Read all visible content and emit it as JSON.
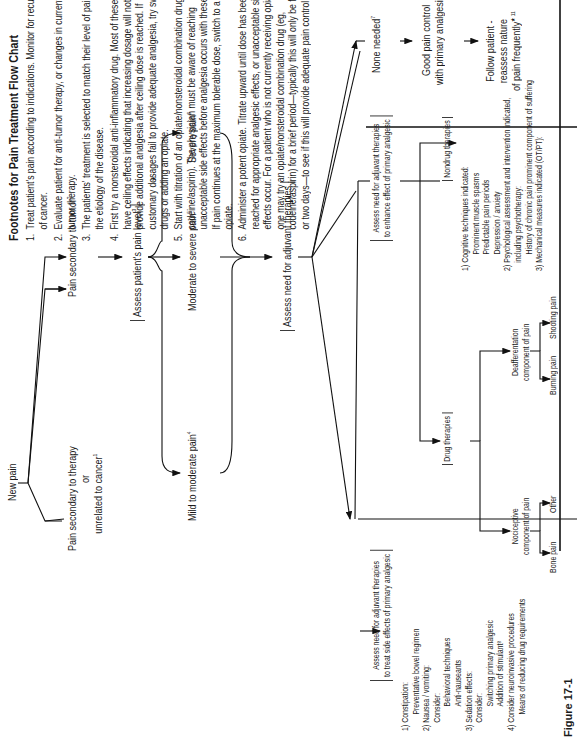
{
  "footnotes": {
    "title": "Footnotes for Pain Treatment Flow Chart",
    "items": [
      {
        "num": "1.",
        "text": "Treat patient's pain according to indications. Monitor for recurrence of cancer."
      },
      {
        "num": "2.",
        "text": "Evaluate patient for anti-tumor therapy, or changes in current anti-tumor therapy."
      },
      {
        "num": "3.",
        "text": "The patients' treatment is selected to match their level of pain, not the etiology of the disease."
      },
      {
        "num": "4.",
        "text": "First try a nonsteroidal anti-inflammatory drug. Most of these drugs have ceiling effects indicating that increasing dosage will not provide additional analgesia after ceiling dose is reached. If customary dosages fail to provide adequate analgesia, try switching drugs or adding an opiate."
      },
      {
        "num": "5.",
        "text": "Start with titration of an opiate/nonsteroidal combination drug (eg, codeine/aspirin). The physician must be aware of reaching unacceptable side effects before analgesia occurs with these drugs. If pain continues at the maximum tolerable dose, switch to a potent opiate."
      },
      {
        "num": "6.",
        "text": "Administer a potent opiate. Titrate upward until dose has been reached for appropriate analgesic effects, or unacceptable side effects occur. For a patient who is not currently receiving opiates, one may try an opiate/nonsteroidal combination drug (eg, codeine/aspirin) for a brief period—typically this will only be for one or two days—to see if this will provide adequate pain control."
      }
    ]
  },
  "flow": {
    "new_pain": "New pain",
    "pain_tumor": "Pain secondary to tumor",
    "pain_tumor_sup": "2",
    "pain_therapy_l1": "Pain secondary to therapy",
    "pain_therapy_l2": "or",
    "pain_therapy_l3": "unrelated to cancer",
    "pain_therapy_sup": "1",
    "assess_level": "Assess patient's pain level",
    "assess_level_sup": "3",
    "asterisk": "*",
    "mild": "Mild to moderate pain",
    "mild_sup": "4",
    "moderate": "Moderate to severe pain",
    "moderate_sup": "5",
    "severe": "Severe pain",
    "severe_sup": "6",
    "assess_adjuvant": "Assess need for adjuvant therapies",
    "none_needed": "None needed",
    "none_needed_sup": "7",
    "good_control_l1": "Good pain control",
    "good_control_l2": "with primary analgesic",
    "follow_l1": "Follow patient -",
    "follow_l2": "reassess nature",
    "follow_l3": "of pain frequently",
    "follow_sup": "★ 11",
    "enhance_l1": "Assess need for adjuvant therapies",
    "enhance_l2": "to enhance effect of primary analgesic",
    "side_l1": "Assess need for adjuvant therapies",
    "side_l2": "to treat side effects of primary analgesic"
  },
  "drug_therapies": {
    "label": "Drug therapies",
    "nociceptive_l1": "Nociceptive",
    "nociceptive_l2": "component of pain",
    "bone_pain": "Bone pain",
    "bone_drugs": [
      "Nonsteroidals",
      "Steroids",
      "L-dopa"
    ],
    "other": "Other",
    "other_drugs": [
      "ASA",
      "acetominophen",
      "Nonsteroidals"
    ],
    "deaff_l1": "Deafferentation",
    "deaff_l2": "component of pain",
    "burning_l1": "Burning",
    "burning_l2": "pain",
    "burning_drug": "Tricyclics",
    "shooting_l1": "Shooting",
    "shooting_l2": "pain",
    "shooting_drug": "Anticonvulsants"
  },
  "nondrug_therapies": {
    "label": "Nondrug therapies",
    "lines": [
      {
        "text": "1) Cognitive techniques indicated:",
        "indent": 0
      },
      {
        "text": "Prominent muscle spasms",
        "indent": 2
      },
      {
        "text": "Predictable pain periods",
        "indent": 2
      },
      {
        "text": "Depression / anxiety",
        "indent": 2
      },
      {
        "text": "2) Psychological assessment and intervention indicated,",
        "indent": 0
      },
      {
        "text": "including psychotherapy:",
        "indent": 1
      },
      {
        "text": "History of chronic pain prominent component of suffering",
        "indent": 2
      },
      {
        "text": "3) Mechanical measures indicated (OT/PT):",
        "indent": 0
      },
      {
        "text": "Prominent component of incident pain",
        "indent": 2
      },
      {
        "text": "Benefit from orthotic or prosthetic devices",
        "indent": 2
      },
      {
        "text": "4) Peripheral neuroaugmentative procedures indicated¹⁰",
        "indent": 0
      },
      {
        "text": "Localized pain",
        "indent": 2
      },
      {
        "text": "Deafferentation type pain",
        "indent": 2
      }
    ]
  },
  "side_effects": {
    "lines": [
      {
        "text": "1) Constipation:",
        "indent": 0
      },
      {
        "text": "Preventative bowel regimen",
        "indent": 2
      },
      {
        "text": "2) Nausea / vomiting:",
        "indent": 0
      },
      {
        "text": "Consider:",
        "indent": 1
      },
      {
        "text": "Behavioral techniques",
        "indent": 3
      },
      {
        "text": "Anti-nauseants",
        "indent": 3
      },
      {
        "text": "3) Sedation effects:",
        "indent": 0
      },
      {
        "text": "Consider:",
        "indent": 1
      },
      {
        "text": "Switching primary analgesic",
        "indent": 3
      },
      {
        "text": "Addition of stimulant⁸",
        "indent": 3
      },
      {
        "text": "4) Consider neuroinvasive procedures",
        "indent": 0
      },
      {
        "text": "Means of reducing drug requirements",
        "indent": 2
      }
    ]
  },
  "figure_label": "Figure 17-1"
}
